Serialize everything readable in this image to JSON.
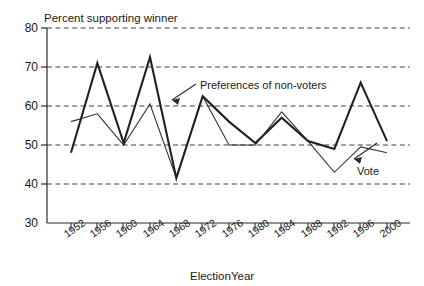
{
  "chart_data": {
    "type": "line",
    "title": "",
    "ylabel": "Percent supporting winner",
    "xlabel": "ElectionYear",
    "ylim": [
      30,
      80
    ],
    "yticks": [
      30,
      40,
      50,
      60,
      70,
      80
    ],
    "grid": true,
    "grid_style": "dashed-horizontal",
    "legend_position": "inline-annotations",
    "categories": [
      "1952",
      "1956",
      "1960",
      "1964",
      "1968",
      "1972",
      "1976",
      "1980",
      "1984",
      "1988",
      "1992",
      "1996",
      "2000"
    ],
    "x": [
      1952,
      1956,
      1960,
      1964,
      1968,
      1972,
      1976,
      1980,
      1984,
      1988,
      1992,
      1996,
      2000
    ],
    "series": [
      {
        "name": "Preferences of non-voters",
        "style": "thick",
        "color": "#222222",
        "values": [
          48.0,
          71.0,
          50.5,
          72.5,
          41.5,
          62.5,
          56.0,
          50.5,
          57.0,
          51.0,
          49.0,
          66.0,
          51.0
        ]
      },
      {
        "name": "Vote",
        "style": "thin",
        "color": "#333333",
        "values": [
          56.0,
          58.0,
          50.0,
          60.5,
          41.5,
          62.5,
          50.0,
          50.0,
          58.5,
          51.0,
          43.0,
          49.5,
          48.0
        ]
      }
    ],
    "annotations": [
      {
        "text": "Preferences of non-voters",
        "arrow": "points-up-left",
        "target_year": 1968
      },
      {
        "text": "Vote",
        "arrow": "points-down-left",
        "target_year": 1996
      }
    ]
  },
  "axes": {
    "y_title": "Percent supporting winner",
    "x_title": "ElectionYear",
    "y_tick_labels": [
      "80",
      "70",
      "60",
      "50",
      "40",
      "30"
    ],
    "x_tick_labels": [
      "1952",
      "1956",
      "1960",
      "1964",
      "1968",
      "1972",
      "1976",
      "1980",
      "1984",
      "1988",
      "1992",
      "1996",
      "2000"
    ]
  },
  "annotation_labels": {
    "nonvoters": "Preferences of non-voters",
    "vote": "Vote"
  }
}
